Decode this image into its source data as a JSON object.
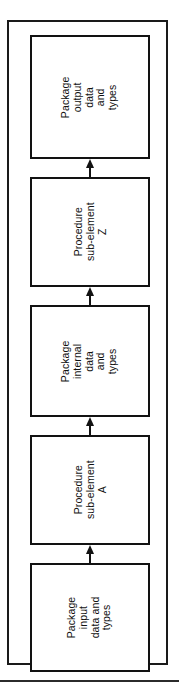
{
  "figure": {
    "type": "flowchart",
    "orientation": "vertical-rotated-90ccw",
    "frame_style": "double-rule-border",
    "colors": {
      "line": "#121212",
      "background": "#ffffff",
      "rule": "#2b2b2b"
    },
    "boxes": [
      {
        "id": "package-output",
        "label": "Package\noutput\ndata\nand\ntypes",
        "lines": [
          "Package",
          "output",
          "data",
          "and",
          "types"
        ],
        "kind": "package"
      },
      {
        "id": "procedure-sub-element-z",
        "label": "Procedure\nsub-element\nZ",
        "lines": [
          "Procedure",
          "sub-element",
          "Z"
        ],
        "kind": "procedure"
      },
      {
        "id": "package-internal",
        "label": "Package\ninternal\ndata\nand\ntypes",
        "lines": [
          "Package",
          "internal",
          "data",
          "and",
          "types"
        ],
        "kind": "package"
      },
      {
        "id": "procedure-sub-element-a",
        "label": "Procedure\nsub-element\nA",
        "lines": [
          "Procedure",
          "sub-element",
          "A"
        ],
        "kind": "procedure"
      },
      {
        "id": "package-input",
        "label": "Package\ninput\ndata and\ntypes",
        "lines": [
          "Package",
          "input",
          "data and",
          "types"
        ],
        "kind": "package"
      }
    ],
    "arrows": [
      {
        "id": "arrow-input-to-proc-a",
        "from": "package-input",
        "to": "procedure-sub-element-a",
        "direction": "up"
      },
      {
        "id": "arrow-proc-a-to-internal",
        "from": "procedure-sub-element-a",
        "to": "package-internal",
        "direction": "up"
      },
      {
        "id": "arrow-internal-to-proc-z",
        "from": "package-internal",
        "to": "procedure-sub-element-z",
        "direction": "up"
      },
      {
        "id": "arrow-proc-z-to-output",
        "from": "procedure-sub-element-z",
        "to": "package-output",
        "direction": "up"
      }
    ]
  }
}
